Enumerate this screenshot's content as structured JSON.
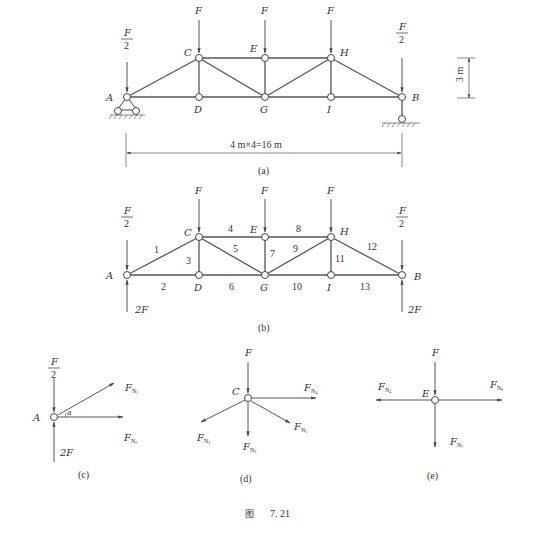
{
  "figure": {
    "caption_prefix": "图",
    "caption_number": "7. 21"
  },
  "panel_a": {
    "label": "(a)",
    "nodes": {
      "A": "A",
      "B": "B",
      "C": "C",
      "D": "D",
      "E": "E",
      "G": "G",
      "H": "H",
      "I": "I"
    },
    "loads": {
      "top": "F",
      "end_num": "F",
      "end_den": "2"
    },
    "height_dim": "3 m",
    "span_dim": "4 m×4=16 m"
  },
  "panel_b": {
    "label": "(b)",
    "nodes": {
      "A": "A",
      "B": "B",
      "C": "C",
      "D": "D",
      "E": "E",
      "G": "G",
      "H": "H",
      "I": "I"
    },
    "loads": {
      "top": "F",
      "end_num": "F",
      "end_den": "2",
      "reaction": "2F"
    },
    "members": [
      "1",
      "2",
      "3",
      "4",
      "5",
      "6",
      "7",
      "8",
      "9",
      "10",
      "11",
      "12",
      "13"
    ]
  },
  "panel_c": {
    "label": "(c)",
    "node": "A",
    "load_num": "F",
    "load_den": "2",
    "reaction": "2F",
    "angle": "α",
    "forces": [
      {
        "base": "F",
        "sub": "N",
        "idx": "1"
      },
      {
        "base": "F",
        "sub": "N",
        "idx": "2"
      }
    ]
  },
  "panel_d": {
    "label": "(d)",
    "node": "C",
    "load": "F",
    "forces": [
      {
        "base": "F",
        "sub": "N",
        "idx": "4"
      },
      {
        "base": "F",
        "sub": "N",
        "idx": "5"
      },
      {
        "base": "F",
        "sub": "N",
        "idx": "3"
      },
      {
        "base": "F",
        "sub": "N",
        "idx": "1"
      }
    ]
  },
  "panel_e": {
    "label": "(e)",
    "node": "E",
    "load": "F",
    "forces": [
      {
        "base": "F",
        "sub": "N",
        "idx": "4"
      },
      {
        "base": "F",
        "sub": "N",
        "idx": "8"
      },
      {
        "base": "F",
        "sub": "N",
        "idx": "7"
      }
    ]
  }
}
